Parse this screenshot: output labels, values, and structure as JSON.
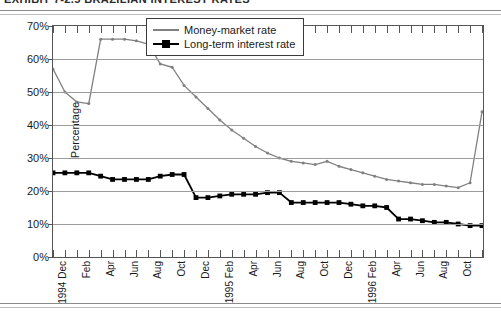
{
  "title": "EXHIBIT 7-2.5   BRAZILIAN INTEREST RATES",
  "chart_data": {
    "type": "line",
    "title": "EXHIBIT 7-2.5   BRAZILIAN INTEREST RATES",
    "xlabel": "",
    "ylabel": "Percentage",
    "ylim": [
      0,
      70
    ],
    "ytick_labels": [
      "0%",
      "10%",
      "20%",
      "30%",
      "40%",
      "50%",
      "60%",
      "70%"
    ],
    "ytick_values": [
      0,
      10,
      20,
      30,
      40,
      50,
      60,
      70
    ],
    "grid": true,
    "legend_position": "top-center",
    "x": [
      "1994 Dec",
      "Jan",
      "Feb",
      "Mar",
      "Apr",
      "May",
      "Jun",
      "Jul",
      "Aug",
      "Sep",
      "Oct",
      "Nov",
      "Dec",
      "1995 Jan",
      "Feb",
      "Mar",
      "Apr",
      "May",
      "Jun",
      "Jul",
      "Aug",
      "Sep",
      "Oct",
      "Nov",
      "Dec",
      "1996 Jan",
      "Feb",
      "Mar",
      "Apr",
      "May",
      "Jun",
      "Jul",
      "Aug",
      "Sep",
      "Oct",
      "Nov",
      "Dec"
    ],
    "xtick_labels": [
      {
        "index": 0,
        "label": "1994 Dec",
        "year": "1994",
        "month": "Dec"
      },
      {
        "index": 2,
        "label": "Feb",
        "year": "",
        "month": "Feb"
      },
      {
        "index": 4,
        "label": "Apr",
        "year": "",
        "month": "Apr"
      },
      {
        "index": 6,
        "label": "Jun",
        "year": "",
        "month": "Jun"
      },
      {
        "index": 8,
        "label": "Aug",
        "year": "",
        "month": "Aug"
      },
      {
        "index": 10,
        "label": "Oct",
        "year": "",
        "month": "Oct"
      },
      {
        "index": 12,
        "label": "Dec",
        "year": "",
        "month": "Dec"
      },
      {
        "index": 14,
        "label": "1995 Feb",
        "year": "1995",
        "month": "Feb"
      },
      {
        "index": 16,
        "label": "Apr",
        "year": "",
        "month": "Apr"
      },
      {
        "index": 18,
        "label": "Jun",
        "year": "",
        "month": "Jun"
      },
      {
        "index": 20,
        "label": "Aug",
        "year": "",
        "month": "Aug"
      },
      {
        "index": 22,
        "label": "Oct",
        "year": "",
        "month": "Oct"
      },
      {
        "index": 24,
        "label": "Dec",
        "year": "",
        "month": "Dec"
      },
      {
        "index": 26,
        "label": "1996 Feb",
        "year": "1996",
        "month": "Feb"
      },
      {
        "index": 28,
        "label": "Apr",
        "year": "",
        "month": "Apr"
      },
      {
        "index": 30,
        "label": "Jun",
        "year": "",
        "month": "Jun"
      },
      {
        "index": 32,
        "label": "Aug",
        "year": "",
        "month": "Aug"
      },
      {
        "index": 34,
        "label": "Oct",
        "year": "",
        "month": "Oct"
      }
    ],
    "series": [
      {
        "name": "Money-market rate",
        "color": "#808080",
        "marker": "none",
        "values": [
          57,
          50,
          47,
          46.5,
          66,
          66,
          66,
          65.5,
          64.5,
          58.5,
          57.5,
          52,
          48.5,
          45,
          41.5,
          38.5,
          36,
          33.5,
          31.5,
          30,
          29,
          28.5,
          28,
          29,
          27.5,
          26.5,
          25.5,
          24.5,
          23.5,
          23,
          22.5,
          22,
          22,
          21.5,
          21,
          22.5,
          44
        ]
      },
      {
        "name": "Long-term interest rate",
        "color": "#000000",
        "marker": "square",
        "values": [
          25.5,
          25.5,
          25.5,
          25.5,
          24.5,
          23.5,
          23.5,
          23.5,
          23.5,
          24.5,
          25,
          25,
          18,
          18,
          18.5,
          19,
          19,
          19,
          19.5,
          19.5,
          16.5,
          16.5,
          16.5,
          16.5,
          16.5,
          16,
          15.5,
          15.5,
          15,
          11.5,
          11.5,
          11,
          10.5,
          10.5,
          10,
          9.5,
          9.5
        ]
      }
    ]
  }
}
